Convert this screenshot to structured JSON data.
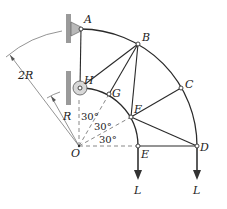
{
  "figure": {
    "type": "plane truss diagram",
    "joints": {
      "A": {
        "label": "A"
      },
      "B": {
        "label": "B"
      },
      "C": {
        "label": "C"
      },
      "D": {
        "label": "D"
      },
      "E": {
        "label": "E"
      },
      "F": {
        "label": "F"
      },
      "G": {
        "label": "G"
      },
      "H": {
        "label": "H"
      },
      "O": {
        "label": "O"
      }
    },
    "members": [
      "AH",
      "AB",
      "BC",
      "CD",
      "HG",
      "GF",
      "FE",
      "HB",
      "GB",
      "FB",
      "FC",
      "FD",
      "ED"
    ],
    "dimensions": {
      "outer_radius": "2R",
      "inner_radius": "R"
    },
    "angles": [
      {
        "label": "30°"
      },
      {
        "label": "30°"
      },
      {
        "label": "30°"
      }
    ],
    "loads": [
      {
        "at": "E",
        "label": "L",
        "direction": "down"
      },
      {
        "at": "D",
        "label": "L",
        "direction": "down"
      }
    ],
    "supports": [
      {
        "at": "A",
        "type": "pin bracket on wall"
      },
      {
        "at": "H",
        "type": "pin on wall"
      }
    ]
  }
}
